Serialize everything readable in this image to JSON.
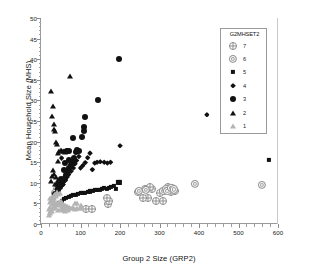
{
  "chart_data": {
    "type": "scatter",
    "title": "",
    "xlabel": "Group 2 Size (GRP2)",
    "ylabel": "Mean Household Size (MHS)",
    "xlim": [
      0,
      600
    ],
    "ylim": [
      0,
      50
    ],
    "xticks": [
      0,
      100,
      200,
      300,
      400,
      500,
      600
    ],
    "yticks": [
      0,
      5,
      10,
      15,
      20,
      25,
      30,
      35,
      40,
      45,
      50
    ],
    "x_minor_step": 20,
    "y_minor_step": 1,
    "grid": false,
    "legend": {
      "title": "G2MHSET2",
      "position": "top-right",
      "entries": [
        {
          "label": "7",
          "marker": "crossed-circle",
          "color": "#8e8e8e"
        },
        {
          "label": "6",
          "marker": "double-circle",
          "color": "#9c9c9c"
        },
        {
          "label": "5",
          "marker": "filled-square",
          "color": "#111111"
        },
        {
          "label": "4",
          "marker": "filled-diamond",
          "color": "#111111"
        },
        {
          "label": "3",
          "marker": "filled-circle",
          "color": "#111111"
        },
        {
          "label": "2",
          "marker": "filled-triangle",
          "color": "#111111"
        },
        {
          "label": "1",
          "marker": "open-triangle",
          "color": "#b4b4b4"
        }
      ]
    },
    "series": [
      {
        "name": "7",
        "marker": "crossed-circle",
        "color": "#8e8e8e",
        "points": [
          [
            113,
            3.6
          ],
          [
            128,
            3.6
          ],
          [
            170,
            4.9
          ],
          [
            171,
            5.6
          ],
          [
            168,
            6.2
          ],
          [
            246,
            7.8
          ],
          [
            263,
            8.4
          ],
          [
            268,
            8.6
          ],
          [
            272,
            6.3
          ],
          [
            281,
            8.6
          ],
          [
            290,
            5.6
          ],
          [
            308,
            5.6
          ],
          [
            312,
            8.0
          ],
          [
            318,
            8.5
          ],
          [
            322,
            9.0
          ],
          [
            326,
            8.3
          ],
          [
            330,
            7.8
          ],
          [
            334,
            8.6
          ],
          [
            338,
            8.0
          ],
          [
            276,
            9.0
          ],
          [
            300,
            7.6
          ],
          [
            258,
            6.4
          ]
        ]
      },
      {
        "name": "6",
        "marker": "double-circle",
        "color": "#9c9c9c",
        "points": [
          [
            248,
            8.0
          ],
          [
            265,
            8.2
          ],
          [
            310,
            8.1
          ],
          [
            316,
            8.6
          ],
          [
            320,
            8.1
          ],
          [
            330,
            8.7
          ],
          [
            336,
            8.4
          ],
          [
            390,
            9.7
          ],
          [
            560,
            9.5
          ],
          [
            46,
            9.4
          ],
          [
            40,
            8.6
          ],
          [
            35,
            7.6
          ]
        ]
      },
      {
        "name": "5",
        "marker": "filled-square",
        "color": "#111111",
        "points": [
          [
            58,
            6.0
          ],
          [
            64,
            6.4
          ],
          [
            70,
            6.6
          ],
          [
            76,
            6.8
          ],
          [
            82,
            7.0
          ],
          [
            88,
            7.1
          ],
          [
            94,
            7.3
          ],
          [
            100,
            7.5
          ],
          [
            106,
            7.6
          ],
          [
            112,
            7.6
          ],
          [
            118,
            7.8
          ],
          [
            124,
            7.9
          ],
          [
            130,
            8.0
          ],
          [
            136,
            8.2
          ],
          [
            142,
            8.3
          ],
          [
            148,
            8.2
          ],
          [
            154,
            8.6
          ],
          [
            160,
            8.8
          ],
          [
            166,
            8.5
          ],
          [
            172,
            8.7
          ],
          [
            178,
            9.0
          ],
          [
            184,
            9.2
          ],
          [
            190,
            8.5
          ],
          [
            196,
            10.1
          ],
          [
            200,
            10.1
          ],
          [
            578,
            15.6
          ],
          [
            52,
            5.6
          ],
          [
            46,
            5.2
          ]
        ]
      },
      {
        "name": "4",
        "marker": "filled-diamond",
        "color": "#111111",
        "points": [
          [
            48,
            9.0
          ],
          [
            56,
            9.6
          ],
          [
            62,
            10.6
          ],
          [
            66,
            11.4
          ],
          [
            70,
            12.0
          ],
          [
            76,
            12.8
          ],
          [
            82,
            13.6
          ],
          [
            86,
            14.6
          ],
          [
            90,
            15.4
          ],
          [
            96,
            16.4
          ],
          [
            100,
            13.6
          ],
          [
            106,
            14.2
          ],
          [
            112,
            14.9
          ],
          [
            118,
            16.1
          ],
          [
            124,
            17.2
          ],
          [
            130,
            13.2
          ],
          [
            136,
            14.8
          ],
          [
            142,
            15.0
          ],
          [
            150,
            15.1
          ],
          [
            160,
            15.0
          ],
          [
            168,
            14.8
          ],
          [
            176,
            15.0
          ],
          [
            200,
            19.0
          ],
          [
            420,
            26.5
          ],
          [
            58,
            17.6
          ],
          [
            64,
            17.8
          ],
          [
            52,
            16.0
          ],
          [
            44,
            10.0
          ]
        ]
      },
      {
        "name": "3",
        "marker": "filled-circle",
        "color": "#111111",
        "points": [
          [
            36,
            7.4
          ],
          [
            42,
            8.2
          ],
          [
            48,
            8.9
          ],
          [
            52,
            9.6
          ],
          [
            56,
            10.4
          ],
          [
            60,
            11.2
          ],
          [
            64,
            12.0
          ],
          [
            68,
            12.8
          ],
          [
            72,
            13.6
          ],
          [
            76,
            14.4
          ],
          [
            80,
            15.2
          ],
          [
            84,
            16.0
          ],
          [
            88,
            17.4
          ],
          [
            72,
            17.6
          ],
          [
            66,
            17.6
          ],
          [
            80,
            20.8
          ],
          [
            108,
            23.6
          ],
          [
            110,
            22.6
          ],
          [
            112,
            26.0
          ],
          [
            144,
            30.0
          ],
          [
            198,
            40.0
          ],
          [
            58,
            13.0
          ],
          [
            50,
            11.0
          ],
          [
            44,
            9.4
          ],
          [
            62,
            14.8
          ],
          [
            70,
            15.6
          ],
          [
            90,
            18.0
          ],
          [
            96,
            17.6
          ],
          [
            104,
            21.0
          ]
        ]
      },
      {
        "name": "2",
        "marker": "filled-triangle",
        "color": "#111111",
        "points": [
          [
            26,
            32.2
          ],
          [
            28,
            26.2
          ],
          [
            30,
            28.6
          ],
          [
            32,
            24.2
          ],
          [
            34,
            23.0
          ],
          [
            36,
            22.6
          ],
          [
            38,
            20.0
          ],
          [
            40,
            19.4
          ],
          [
            42,
            17.2
          ],
          [
            44,
            15.4
          ],
          [
            46,
            17.8
          ],
          [
            50,
            18.0
          ],
          [
            54,
            17.6
          ],
          [
            58,
            17.8
          ],
          [
            62,
            17.4
          ],
          [
            74,
            36.0
          ],
          [
            30,
            13.0
          ],
          [
            34,
            12.2
          ],
          [
            38,
            11.4
          ],
          [
            42,
            10.8
          ],
          [
            46,
            10.2
          ],
          [
            28,
            11.6
          ],
          [
            26,
            10.4
          ],
          [
            36,
            9.6
          ],
          [
            40,
            9.0
          ]
        ]
      },
      {
        "name": "1",
        "marker": "open-triangle",
        "color": "#b4b4b4",
        "points": [
          [
            20,
            2.2
          ],
          [
            22,
            2.6
          ],
          [
            24,
            3.0
          ],
          [
            26,
            3.4
          ],
          [
            28,
            3.2
          ],
          [
            30,
            3.8
          ],
          [
            32,
            4.0
          ],
          [
            34,
            4.4
          ],
          [
            36,
            4.2
          ],
          [
            38,
            4.8
          ],
          [
            40,
            5.0
          ],
          [
            42,
            5.2
          ],
          [
            44,
            4.6
          ],
          [
            46,
            5.4
          ],
          [
            48,
            5.0
          ],
          [
            50,
            5.6
          ],
          [
            52,
            4.4
          ],
          [
            54,
            5.2
          ],
          [
            56,
            4.8
          ],
          [
            58,
            4.2
          ],
          [
            60,
            4.6
          ],
          [
            62,
            4.0
          ],
          [
            66,
            4.4
          ],
          [
            70,
            4.2
          ],
          [
            74,
            4.0
          ],
          [
            78,
            3.8
          ],
          [
            82,
            4.2
          ],
          [
            86,
            3.6
          ],
          [
            92,
            4.0
          ],
          [
            98,
            3.8
          ],
          [
            24,
            6.2
          ],
          [
            28,
            6.6
          ],
          [
            32,
            7.0
          ],
          [
            36,
            7.4
          ],
          [
            40,
            7.8
          ],
          [
            22,
            5.4
          ],
          [
            26,
            5.8
          ],
          [
            30,
            6.0
          ],
          [
            34,
            6.4
          ],
          [
            38,
            6.8
          ],
          [
            44,
            7.2
          ],
          [
            48,
            7.6
          ],
          [
            20,
            3.6
          ],
          [
            24,
            4.2
          ],
          [
            28,
            4.8
          ],
          [
            32,
            5.4
          ],
          [
            36,
            5.0
          ],
          [
            44,
            3.4
          ],
          [
            50,
            3.6
          ],
          [
            56,
            3.4
          ],
          [
            62,
            3.2
          ],
          [
            68,
            3.4
          ],
          [
            86,
            5.0
          ],
          [
            92,
            5.2
          ],
          [
            100,
            4.6
          ],
          [
            104,
            3.9
          ]
        ]
      }
    ]
  }
}
